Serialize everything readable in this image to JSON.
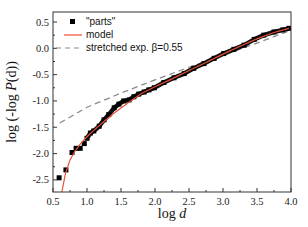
{
  "chart_data": {
    "type": "scatter",
    "title": "",
    "xlabel": "log d",
    "ylabel": "log (-log P(d))",
    "xlim": [
      0.5,
      4.0
    ],
    "ylim": [
      -2.73,
      0.69
    ],
    "xticks": [
      "0.5",
      "1.0",
      "1.5",
      "2.0",
      "2.5",
      "3.0",
      "3.5",
      "4.0"
    ],
    "yticks": [
      "0.5",
      "0.0",
      "-0.5",
      "-1.0",
      "-1.5",
      "-2.0",
      "-2.5"
    ],
    "grid": false,
    "legend_position": "upper left",
    "series": [
      {
        "name": "\"parts\"",
        "style": "square markers",
        "color": "#000000",
        "x": [
          0.59,
          0.69,
          0.78,
          0.84,
          0.9,
          0.96,
          1.0,
          1.05,
          1.1,
          1.18,
          1.25,
          1.32,
          1.4,
          1.47,
          1.54,
          1.62,
          1.69,
          1.76,
          1.84,
          1.91,
          1.99,
          2.13,
          2.28,
          2.43,
          2.57,
          2.72,
          2.87,
          3.01,
          3.16,
          3.31,
          3.46,
          3.6,
          3.75,
          3.88,
          3.97
        ],
        "y": [
          -2.46,
          -2.31,
          -1.98,
          -1.9,
          -1.9,
          -1.81,
          -1.71,
          -1.61,
          -1.57,
          -1.48,
          -1.36,
          -1.26,
          -1.13,
          -1.06,
          -1.0,
          -0.98,
          -0.92,
          -0.87,
          -0.83,
          -0.79,
          -0.75,
          -0.65,
          -0.56,
          -0.48,
          -0.38,
          -0.29,
          -0.19,
          -0.1,
          -0.02,
          0.06,
          0.17,
          0.25,
          0.31,
          0.35,
          0.38
        ]
      },
      {
        "name": "model",
        "style": "solid line",
        "color": "#e8503a",
        "x": [
          0.63,
          0.68,
          0.75,
          0.82,
          0.9,
          1.0,
          1.1,
          1.25,
          1.4,
          1.6,
          1.8,
          2.0,
          2.25,
          2.5,
          2.75,
          3.0,
          3.25,
          3.5,
          3.75,
          3.97
        ],
        "y": [
          -2.73,
          -2.4,
          -2.12,
          -1.96,
          -1.82,
          -1.68,
          -1.56,
          -1.39,
          -1.23,
          -1.04,
          -0.86,
          -0.73,
          -0.58,
          -0.42,
          -0.27,
          -0.11,
          0.04,
          0.18,
          0.3,
          0.38
        ]
      },
      {
        "name": "stretched exp. β=0.55",
        "style": "dashed line",
        "color": "#8a8a8a",
        "x": [
          0.6,
          1.0,
          1.5,
          2.0,
          2.5,
          3.0,
          3.5,
          3.97
        ],
        "y": [
          -1.42,
          -1.12,
          -0.85,
          -0.6,
          -0.36,
          -0.13,
          0.1,
          0.33
        ]
      }
    ]
  },
  "legend": {
    "items": [
      "\"parts\"",
      "model",
      "stretched exp. β=0.55"
    ]
  },
  "axes": {
    "xlabel_main": "log ",
    "xlabel_var": "d",
    "ylabel_prefix": "log (-log ",
    "ylabel_var": "P",
    "ylabel_suffix": "(d))"
  }
}
